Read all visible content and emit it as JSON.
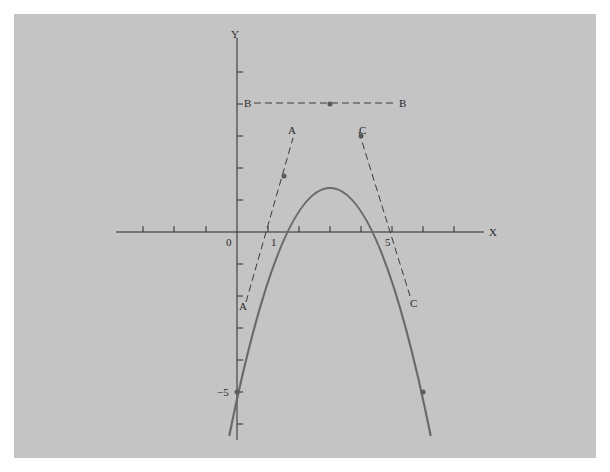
{
  "diagram": {
    "type": "parabola-tangent-lines",
    "function": "y = -(x-1)(x-5) = -x^2 + 6x - 5",
    "axes": {
      "x_label": "X",
      "y_label": "Y",
      "origin_label": "0",
      "x_tick_labels": [
        {
          "value": 1,
          "label": "1"
        },
        {
          "value": 5,
          "label": "5"
        }
      ],
      "y_tick_labels": [
        {
          "value": -5,
          "label": "−5"
        }
      ],
      "x_range": [
        -3,
        8.5
      ],
      "y_range": [
        -6.5,
        6.3
      ]
    },
    "tangent_lines": [
      {
        "name": "A",
        "label_top": "A",
        "label_bottom": "A",
        "point": [
          1.5,
          1.75
        ],
        "slope": 3
      },
      {
        "name": "B",
        "label_left": "B",
        "label_right": "B",
        "point": [
          3,
          4
        ],
        "slope": 0
      },
      {
        "name": "C",
        "label_top": "C",
        "label_bottom": "C",
        "point": [
          4,
          3
        ],
        "slope": -2
      }
    ],
    "marked_points": [
      [
        0,
        -5
      ],
      [
        1.5,
        1.75
      ],
      [
        3,
        4
      ],
      [
        4,
        3
      ],
      [
        6,
        -5
      ]
    ],
    "colors": {
      "background": "#c4c4c4",
      "curve": "#6a6a6a",
      "axis": "#2a2a2a",
      "dashed": "#3a3a3a"
    }
  }
}
